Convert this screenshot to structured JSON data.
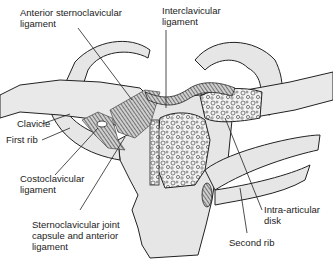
{
  "diagram": {
    "subject": "Sternoclavicular joint",
    "labels": [
      {
        "id": "anterior-sternoclavicular-ligament",
        "lines": [
          "Anterior sternoclavicular",
          "ligament"
        ]
      },
      {
        "id": "interclavicular-ligament",
        "lines": [
          "Interclavicular",
          "ligament"
        ]
      },
      {
        "id": "clavicle",
        "lines": [
          "Clavicle"
        ]
      },
      {
        "id": "first-rib",
        "lines": [
          "First rib"
        ]
      },
      {
        "id": "costoclavicular-ligament",
        "lines": [
          "Costoclavicular",
          "ligament"
        ]
      },
      {
        "id": "sternoclavicular-joint-capsule",
        "lines": [
          "Sternoclavicular joint",
          "capsule and anterior",
          "ligament"
        ]
      },
      {
        "id": "intra-articular-disk",
        "lines": [
          "Intra-articular",
          "disk"
        ]
      },
      {
        "id": "second-rib",
        "lines": [
          "Second rib"
        ]
      }
    ],
    "colors": {
      "bone_fill": "#e6e6e6",
      "outline": "#222222",
      "ligament": "#555555",
      "background": "#ffffff"
    }
  }
}
